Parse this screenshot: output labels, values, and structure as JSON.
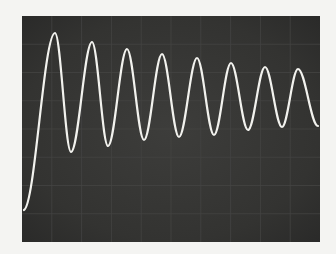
{
  "chart_data": {
    "type": "line",
    "title": "",
    "xlabel": "",
    "ylabel": "",
    "grid": true,
    "screen": {
      "x": 22,
      "y": 16,
      "width": 298,
      "height": 226
    },
    "trace_color": "#f2f2ee",
    "screen_color": "#363634",
    "points": [
      [
        24,
        210
      ],
      [
        55,
        33
      ],
      [
        71,
        152
      ],
      [
        92,
        42
      ],
      [
        108,
        146
      ],
      [
        127,
        49
      ],
      [
        144,
        140
      ],
      [
        162,
        54
      ],
      [
        179,
        137
      ],
      [
        197,
        58
      ],
      [
        214,
        135
      ],
      [
        231,
        63
      ],
      [
        248,
        130
      ],
      [
        265,
        67
      ],
      [
        282,
        127
      ],
      [
        298,
        69
      ],
      [
        318,
        126
      ]
    ],
    "peaks": [
      33,
      42,
      49,
      54,
      58,
      63,
      67,
      69
    ],
    "troughs": [
      152,
      146,
      140,
      137,
      135,
      130,
      127
    ]
  }
}
